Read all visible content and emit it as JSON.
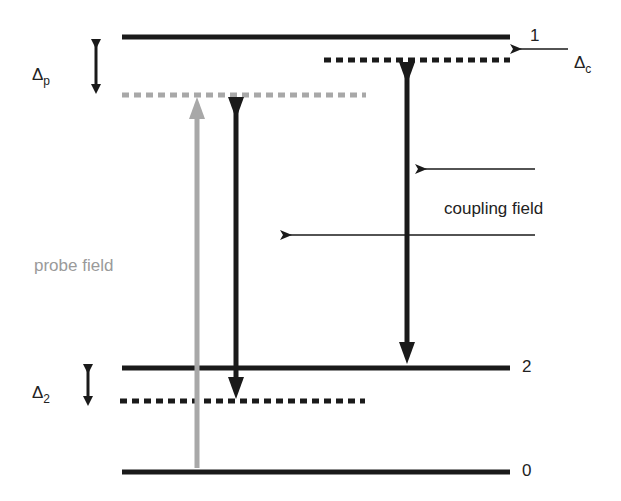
{
  "diagram": {
    "type": "energy-level-diagram",
    "colors": {
      "line": "#1a1a1a",
      "probe": "#a0a0a0",
      "background": "#ffffff"
    },
    "levels": [
      {
        "id": "1",
        "label": "1",
        "style": "solid"
      },
      {
        "id": "2",
        "label": "2",
        "style": "solid"
      },
      {
        "id": "0",
        "label": "0",
        "style": "solid"
      }
    ],
    "virtual_levels": [
      {
        "id": "coupling-detuned",
        "style": "dashed",
        "color": "#1a1a1a"
      },
      {
        "id": "probe-detuned",
        "style": "dashed",
        "color": "#a0a0a0"
      },
      {
        "id": "two-photon-detuned",
        "style": "dashed",
        "color": "#1a1a1a"
      }
    ],
    "detunings": {
      "delta_p": {
        "symbol": "Δ",
        "subscript": "p"
      },
      "delta_c": {
        "symbol": "Δ",
        "subscript": "c"
      },
      "delta_2": {
        "symbol": "Δ",
        "subscript": "2"
      }
    },
    "labels": {
      "probe_field": "probe field",
      "coupling_field": "coupling field"
    }
  }
}
